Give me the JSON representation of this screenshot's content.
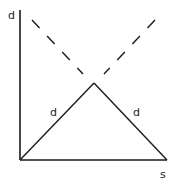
{
  "diagram": {
    "axis_labels": {
      "y": "d",
      "x": "s"
    },
    "edge_labels": {
      "left": "d",
      "right": "d"
    },
    "colors": {
      "stroke": "#1a1a1a",
      "background": "#ffffff"
    }
  }
}
